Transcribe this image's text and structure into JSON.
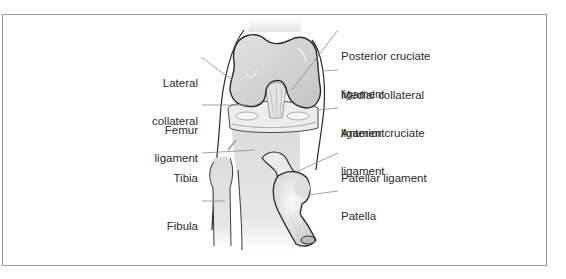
{
  "diagram": {
    "labels_left": [
      {
        "id": "lateral-collateral-ligament",
        "lines": [
          "Lateral",
          "collateral",
          "ligament"
        ]
      },
      {
        "id": "femur",
        "lines": [
          "Femur"
        ]
      },
      {
        "id": "tibia",
        "lines": [
          "Tibia"
        ]
      },
      {
        "id": "fibula",
        "lines": [
          "Fibula"
        ]
      }
    ],
    "labels_right": [
      {
        "id": "posterior-cruciate-ligament",
        "lines": [
          "Posterior cruciate",
          "ligament"
        ]
      },
      {
        "id": "medial-collateral-ligament",
        "lines": [
          "Medial collateral",
          "ligament"
        ]
      },
      {
        "id": "anterior-cruciate-ligament",
        "lines": [
          "Anterior cruciate",
          "ligament"
        ]
      },
      {
        "id": "patellar-ligament",
        "lines": [
          "Patellar ligament"
        ]
      },
      {
        "id": "patella",
        "lines": [
          "Patella"
        ]
      }
    ],
    "colors": {
      "border": "#9a9a9a",
      "outline": "#2a2a2a",
      "bone_fill": "#d2d2d2",
      "bone_light": "#ececec",
      "leader": "#8a8a8a",
      "text": "#2b2b2b"
    }
  }
}
